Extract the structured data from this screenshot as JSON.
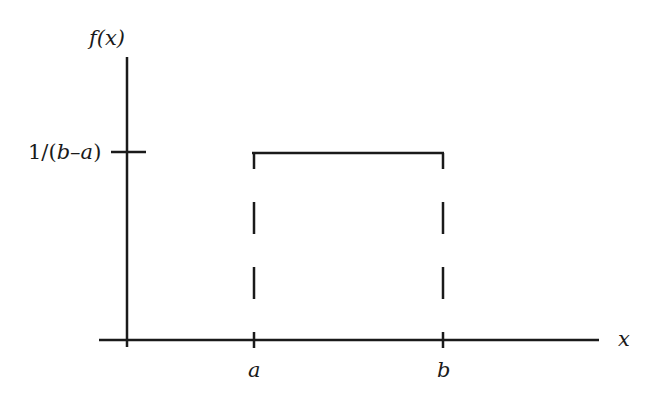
{
  "diagram": {
    "y_axis_label": "f(x)",
    "x_axis_label": "x",
    "y_tick_label": {
      "prefix": "1/(",
      "b": "b",
      "dash": "–",
      "a": "a",
      "suffix": ")"
    },
    "x_tick_labels": [
      "a",
      "b"
    ],
    "colors": {
      "line": "#1a1a1a",
      "background": "#ffffff"
    }
  }
}
